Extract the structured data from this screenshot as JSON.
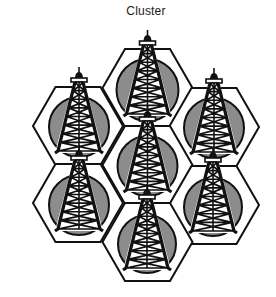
{
  "title": "Cluster",
  "colors": {
    "stroke": "#111111",
    "circle_fill": "#8c8c8c",
    "hex_fill": "#ffffff",
    "background": "#ffffff"
  },
  "hex": {
    "half_width": 45,
    "half_height": 39
  },
  "cells": [
    {
      "id": "top",
      "cx": 147.5,
      "cy": 88,
      "circle": {
        "cx": 147.5,
        "cy": 90,
        "r": 31
      }
    },
    {
      "id": "upper-left",
      "cx": 78,
      "cy": 126,
      "circle": {
        "cx": 79,
        "cy": 127,
        "r": 30
      }
    },
    {
      "id": "upper-right",
      "cx": 214,
      "cy": 127,
      "circle": {
        "cx": 214,
        "cy": 128,
        "r": 30
      }
    },
    {
      "id": "center",
      "cx": 147.5,
      "cy": 165,
      "circle": {
        "cx": 147.5,
        "cy": 166,
        "r": 30
      }
    },
    {
      "id": "lower-left",
      "cx": 78,
      "cy": 203,
      "circle": {
        "cx": 79,
        "cy": 205,
        "r": 30
      }
    },
    {
      "id": "lower-right",
      "cx": 214,
      "cy": 205,
      "circle": {
        "cx": 213,
        "cy": 207,
        "r": 29
      }
    },
    {
      "id": "bottom",
      "cx": 147.5,
      "cy": 242,
      "circle": {
        "cx": 147,
        "cy": 244,
        "r": 29
      }
    }
  ],
  "tower": {
    "top_offset": -60,
    "base_offset": 24,
    "base_half_width": 21,
    "top_half_width": 4,
    "rungs": 8,
    "icon": "radio-tower-icon"
  }
}
